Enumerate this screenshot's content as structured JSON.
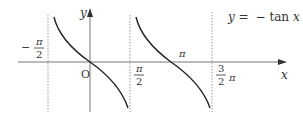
{
  "title": "y = − tan x",
  "title_parts": {
    "y": "y",
    "eq": "=",
    "minus": "−",
    "tan": "tan",
    "x": "x"
  },
  "axes": {
    "x_label": "x",
    "y_label": "y",
    "origin_label": "O"
  },
  "ticks": {
    "neg_half_pi": {
      "sign": "−",
      "num": "π",
      "den": "2"
    },
    "half_pi": {
      "num": "π",
      "den": "2"
    },
    "pi": "π",
    "three_half_pi": {
      "num": "3",
      "den": "2",
      "suffix": "π"
    }
  },
  "colors": {
    "curve": "#222222",
    "axis": "#777777",
    "asymptote": "#999999",
    "text": "#333333"
  }
}
